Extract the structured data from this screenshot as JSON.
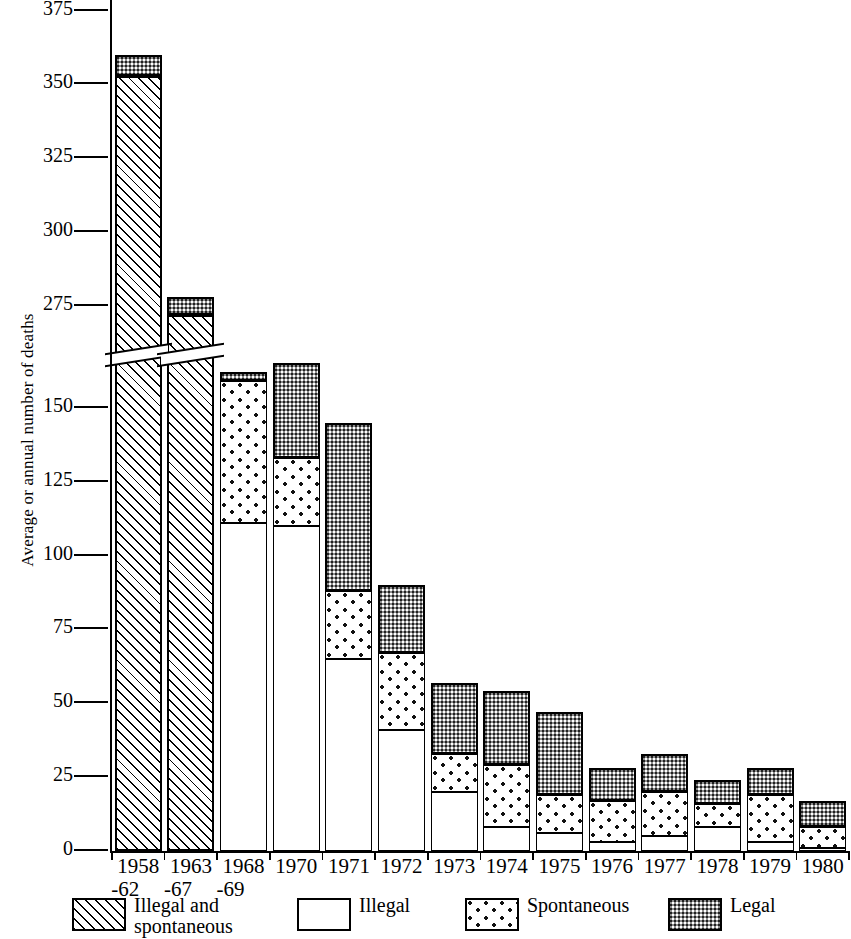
{
  "chart_data": {
    "type": "bar",
    "stacked": true,
    "title": "",
    "xlabel": "",
    "ylabel": "Average or annual number of deaths",
    "grid": false,
    "legend_position": "bottom",
    "ytick_labels": [
      "0",
      "25",
      "50",
      "75",
      "100",
      "125",
      "150",
      "275",
      "300",
      "325",
      "350",
      "375"
    ],
    "ylim_lower": [
      0,
      165
    ],
    "ylim_upper": [
      270,
      380
    ],
    "axis_break": true,
    "axis_break_note": "y-axis broken between 165 and 270",
    "categories": [
      "1958\n-62",
      "1963\n-67",
      "1968\n-69",
      "1970",
      "1971",
      "1972",
      "1973",
      "1974",
      "1975",
      "1976",
      "1977",
      "1978",
      "1979",
      "1980"
    ],
    "category_labels": [
      {
        "main": "1958",
        "sub": "-62"
      },
      {
        "main": "1963",
        "sub": "-67"
      },
      {
        "main": "1968",
        "sub": "-69"
      },
      {
        "main": "1970",
        "sub": ""
      },
      {
        "main": "1971",
        "sub": ""
      },
      {
        "main": "1972",
        "sub": ""
      },
      {
        "main": "1973",
        "sub": ""
      },
      {
        "main": "1974",
        "sub": ""
      },
      {
        "main": "1975",
        "sub": ""
      },
      {
        "main": "1976",
        "sub": ""
      },
      {
        "main": "1977",
        "sub": ""
      },
      {
        "main": "1978",
        "sub": ""
      },
      {
        "main": "1979",
        "sub": ""
      },
      {
        "main": "1980",
        "sub": ""
      }
    ],
    "series": [
      {
        "name": "Illegal and spontaneous",
        "pattern": "diagonal-hatch",
        "values": [
          353,
          272,
          0,
          0,
          0,
          0,
          0,
          0,
          0,
          0,
          0,
          0,
          0,
          0
        ]
      },
      {
        "name": "Illegal",
        "pattern": "white",
        "values": [
          0,
          0,
          111,
          110,
          65,
          41,
          20,
          8,
          6,
          3,
          5,
          8,
          3,
          1
        ]
      },
      {
        "name": "Spontaneous",
        "pattern": "dotted",
        "values": [
          0,
          0,
          48,
          23,
          23,
          26,
          13,
          21,
          13,
          14,
          15,
          8,
          16,
          7
        ]
      },
      {
        "name": "Legal",
        "pattern": "dark-stipple",
        "values": [
          7,
          6,
          3,
          32,
          57,
          23,
          24,
          25,
          28,
          11,
          13,
          8,
          9,
          9
        ]
      }
    ],
    "totals": [
      360,
      278,
      162,
      165,
      145,
      90,
      57,
      54,
      47,
      28,
      33,
      24,
      28,
      17
    ]
  },
  "legend": {
    "items": [
      {
        "label": "Illegal and\nspontaneous",
        "pattern": "diagonal-hatch"
      },
      {
        "label": "Illegal",
        "pattern": "white"
      },
      {
        "label": "Spontaneous",
        "pattern": "dotted"
      },
      {
        "label": "Legal",
        "pattern": "dark-stipple"
      }
    ]
  },
  "colors": {
    "axis": "#000000",
    "legal_fill": "#8d8d8d",
    "illegal_fill": "#ffffff",
    "background": "#ffffff"
  }
}
